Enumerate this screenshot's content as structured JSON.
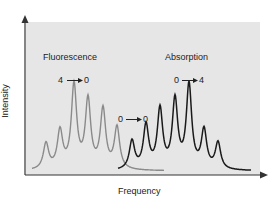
{
  "chart_data": {
    "type": "line",
    "title": "",
    "xlabel": "Frequency",
    "ylabel": "Intensity",
    "grid": false,
    "background": "#e6e6e6",
    "series": [
      {
        "name": "Fluorescence",
        "color": "#8a8a8a",
        "transition_label": "4 → 0",
        "peaks_x": [
          46,
          60,
          74,
          88,
          103,
          117
        ],
        "peaks_rel_height": [
          0.31,
          0.45,
          1.0,
          0.82,
          0.71,
          0.5
        ]
      },
      {
        "name": "Absorption",
        "color": "#1a1a1a",
        "transition_label": "0 → 4",
        "peaks_x": [
          132,
          146,
          160,
          175,
          189,
          204,
          218
        ],
        "peaks_rel_height": [
          0.34,
          0.52,
          0.71,
          0.82,
          1.0,
          0.46,
          0.32
        ]
      }
    ],
    "annotations": [
      {
        "text": "Fluorescence",
        "x": 43,
        "y": 52
      },
      {
        "text": "Absorption",
        "x": 165,
        "y": 52
      },
      {
        "text": "4",
        "arrow": "→",
        "to": "0",
        "x": 58,
        "y": 74
      },
      {
        "text": "0",
        "arrow": "→",
        "to": "4",
        "x": 174,
        "y": 74
      },
      {
        "text": "0",
        "arrow": "→",
        "to": "0",
        "x": 118,
        "y": 113
      }
    ]
  },
  "labels": {
    "fluorescence": "Fluorescence",
    "absorption": "Absorption",
    "f_from": "4",
    "f_to": "0",
    "a_from": "0",
    "a_to": "4",
    "zz_from": "0",
    "zz_to": "0",
    "xlabel": "Frequency",
    "ylabel": "Intensity"
  }
}
